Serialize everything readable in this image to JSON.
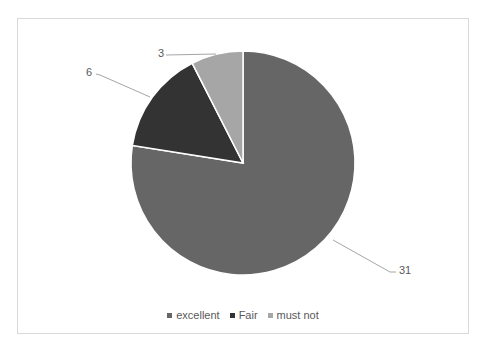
{
  "chart_data": {
    "type": "pie",
    "title": "",
    "categories": [
      "excellent",
      "Fair",
      "must not"
    ],
    "values": [
      31,
      6,
      3
    ],
    "colors": [
      "#666666",
      "#333333",
      "#a6a6a6"
    ],
    "data_labels": [
      "31",
      "6",
      "3"
    ],
    "start_angle_deg": 0,
    "direction": "clockwise",
    "legend_position": "bottom",
    "grid": false
  },
  "legend": {
    "items": [
      {
        "label": "excellent",
        "color": "#666666"
      },
      {
        "label": "Fair",
        "color": "#333333"
      },
      {
        "label": "must not",
        "color": "#a6a6a6"
      }
    ]
  },
  "labels": {
    "excellent": "31",
    "fair": "6",
    "must_not": "3"
  }
}
